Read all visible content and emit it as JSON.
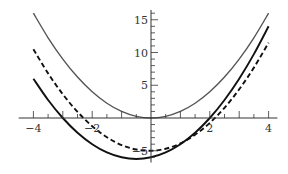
{
  "chart_data": {
    "type": "line",
    "title": "",
    "xlabel": "",
    "ylabel": "",
    "xlim": [
      -4.5,
      4.3
    ],
    "ylim": [
      -6.8,
      16.5
    ],
    "grid": false,
    "legend": null,
    "x_ticks": [
      {
        "value": -4,
        "label": "-4"
      },
      {
        "value": -2,
        "label": "-2"
      },
      {
        "value": 2,
        "label": "2"
      },
      {
        "value": 4,
        "label": "4"
      }
    ],
    "x_minor_step": 0.5,
    "y_ticks": [
      {
        "value": -5,
        "label": "-5"
      },
      {
        "value": 5,
        "label": "5"
      },
      {
        "value": 10,
        "label": "10"
      },
      {
        "value": 15,
        "label": "15"
      }
    ],
    "y_minor_step": 1,
    "series": [
      {
        "name": "y = x^2",
        "style": "solid",
        "color": "#555555",
        "x": [
          -4,
          -3.5,
          -3,
          -2.5,
          -2,
          -1.5,
          -1,
          -0.5,
          0,
          0.5,
          1,
          1.5,
          2,
          2.5,
          3,
          3.5,
          4
        ],
        "y": [
          16,
          12.25,
          9,
          6.25,
          4,
          2.25,
          1,
          0.25,
          0,
          0.25,
          1,
          2.25,
          4,
          6.25,
          9,
          12.25,
          16
        ]
      },
      {
        "name": "y = x^2 + x - 6",
        "style": "solid",
        "color": "#111111",
        "x": [
          -4,
          -3.5,
          -3,
          -2.5,
          -2,
          -1.5,
          -1,
          -0.5,
          0,
          0.5,
          1,
          1.5,
          2,
          2.5,
          3,
          3.5,
          4
        ],
        "y": [
          6,
          2.75,
          0,
          -2.25,
          -4,
          -5.25,
          -6,
          -6.25,
          -6,
          -5.25,
          -4,
          -2.25,
          0,
          2.75,
          6,
          9.75,
          14
        ]
      },
      {
        "name": "y = x^2 + 0.125x - 5",
        "style": "dashed",
        "color": "#111111",
        "x": [
          -4,
          -3.5,
          -3,
          -2.5,
          -2,
          -1.5,
          -1,
          -0.5,
          0,
          0.5,
          1,
          1.5,
          2,
          2.5,
          3,
          3.5,
          4
        ],
        "y": [
          10.5,
          6.81,
          3.63,
          0.94,
          -1.25,
          -2.94,
          -4.13,
          -4.81,
          -5,
          -4.69,
          -3.88,
          -2.56,
          -0.75,
          1.56,
          4.38,
          7.69,
          11.5
        ]
      }
    ]
  }
}
